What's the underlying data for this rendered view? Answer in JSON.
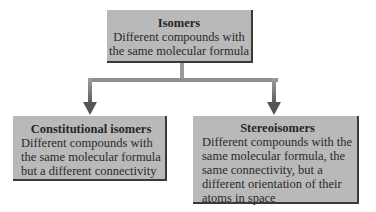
{
  "diagram": {
    "type": "hierarchy",
    "colors": {
      "box_fill": "#b9b9b9",
      "box_shadow": "#3a3a3a",
      "connector": "#8a8a8a",
      "text": "#2a2a2a"
    },
    "root": {
      "title": "Isomers",
      "description": "Different compounds with the same molecular formula"
    },
    "children": [
      {
        "title": "Constitutional isomers",
        "description": "Different compounds with the same molecular formula but a different connectivity"
      },
      {
        "title": "Stereoisomers",
        "description": "Different compounds with the same molecular formula, the same connectivity, but a different orientation of their atoms in space"
      }
    ],
    "edges": [
      {
        "from": "Isomers",
        "to": "Constitutional isomers"
      },
      {
        "from": "Isomers",
        "to": "Stereoisomers"
      }
    ]
  }
}
